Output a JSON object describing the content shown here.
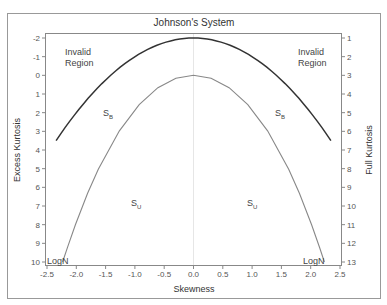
{
  "chart_data": {
    "type": "line",
    "title": "Johnson's System",
    "xlabel": "Skewness",
    "ylabel": "Excess Kurtosis",
    "ylabel_right": "Full Kurtosis",
    "xlim": [
      -2.5,
      2.5
    ],
    "ylim": [
      -2,
      10
    ],
    "y_inverted": true,
    "grid": false,
    "x_ticks": [
      "-2.5",
      "-2.0",
      "-1.5",
      "-1.0",
      "-0.5",
      "0.0",
      "0.5",
      "1.0",
      "1.5",
      "2.0",
      "2.5"
    ],
    "y_ticks_left": [
      "-2",
      "-1",
      "0",
      "1",
      "2",
      "3",
      "4",
      "5",
      "6",
      "7",
      "8",
      "9",
      "10"
    ],
    "y_ticks_right": [
      "1",
      "2",
      "3",
      "4",
      "5",
      "6",
      "7",
      "8",
      "9",
      "10",
      "11",
      "12",
      "13"
    ],
    "series": [
      {
        "name": "Invalid region boundary",
        "color": "#333333",
        "x": [
          -2.345,
          -2.0,
          -1.5,
          -1.0,
          -0.5,
          0.0,
          0.5,
          1.0,
          1.5,
          2.0,
          2.345
        ],
        "y": [
          3.5,
          2.0,
          0.25,
          -1.0,
          -1.75,
          -2.0,
          -1.75,
          -1.0,
          0.25,
          2.0,
          3.5
        ]
      },
      {
        "name": "Lognormal line",
        "color": "#888888",
        "x": [
          -2.233,
          -2.216,
          -2.15,
          -2.016,
          -1.807,
          -1.625,
          -1.264,
          -0.927,
          -0.608,
          -0.301,
          0.0,
          0.301,
          0.608,
          0.927,
          1.264,
          1.625,
          1.807,
          2.016,
          2.15,
          2.216,
          2.233
        ],
        "y": [
          10.0,
          9.84,
          9.21,
          8.0,
          6.32,
          5.035,
          2.969,
          1.566,
          0.664,
          0.1615,
          0.0,
          0.1615,
          0.664,
          1.566,
          2.969,
          5.035,
          6.32,
          8.0,
          9.21,
          9.84,
          10.0
        ]
      }
    ],
    "annotations": [
      {
        "text": "Invalid",
        "text2": "Region",
        "x": -2.2,
        "y": -1.3
      },
      {
        "text": "Invalid",
        "text2": "Region",
        "x": 1.95,
        "y": -1.3
      },
      {
        "text": "S",
        "sub": "B",
        "x": -1.55,
        "y": 2.0
      },
      {
        "text": "S",
        "sub": "B",
        "x": 1.45,
        "y": 2.0
      },
      {
        "text": "S",
        "sub": "U",
        "x": -1.1,
        "y": 7.2
      },
      {
        "text": "S",
        "sub": "U",
        "x": 1.0,
        "y": 7.2
      },
      {
        "text": "LogN",
        "x": -2.45,
        "y": 10
      },
      {
        "text": "LogN",
        "x": 1.88,
        "y": 10
      }
    ]
  },
  "labels": {
    "title": "Johnson's System",
    "xlabel": "Skewness",
    "ylabel": "Excess Kurtosis",
    "ylabel_right": "Full Kurtosis",
    "invalid_line1": "Invalid",
    "invalid_line2": "Region",
    "sb": "S",
    "sb_sub": "B",
    "su": "S",
    "su_sub": "U",
    "logn": "LogN"
  }
}
